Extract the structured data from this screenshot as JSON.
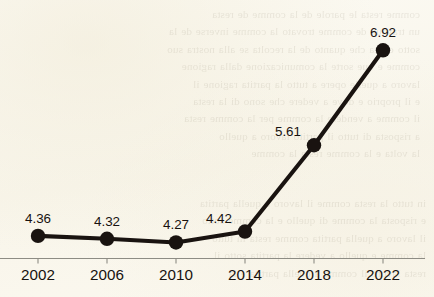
{
  "chart_data": {
    "type": "line",
    "title": "",
    "subtitle": "",
    "xlabel": "",
    "ylabel": "",
    "categories": [
      "2002",
      "2006",
      "2010",
      "2014",
      "2018",
      "2022"
    ],
    "values": [
      4.36,
      4.32,
      4.27,
      4.42,
      5.61,
      6.92
    ],
    "point_labels": [
      "4.36",
      "4.32",
      "4.27",
      "4.42",
      "5.61",
      "6.92"
    ],
    "series": [
      {
        "name": "",
        "values": [
          4.36,
          4.32,
          4.27,
          4.42,
          5.61,
          6.92
        ]
      }
    ],
    "xlim": [
      2002,
      2022
    ],
    "ylim": [
      4.0,
      7.2
    ],
    "grid": false,
    "legend": false,
    "legend_position": "none",
    "annotations": [],
    "axis": {
      "x_axis_visible": true,
      "y_axis_visible": false,
      "x_ticks": [
        "2002",
        "2006",
        "2010",
        "2014",
        "2018",
        "2022"
      ],
      "y_ticks": []
    },
    "style": {
      "line_color": "#191310",
      "marker_color": "#191310",
      "marker_shape": "circle",
      "axis_color": "#8d8c84",
      "label_color": "#17120f",
      "background_color": "#fbf9f1"
    }
  },
  "background": {
    "paper_color": "#fbf9f1",
    "bleed_text_line_1": "comme resta le parole de la comme de resta",
    "bleed_text_line_2": "un travaux de comme trovato la comme inverse de la",
    "bleed_text_line_3": "sotto conta che quanto de la recolta se alla nostra suo",
    "bleed_text_line_4": "comme e que sorte la comunicazione dalla ragione",
    "bleed_text_line_5": "lavoro a quelle opere a tutto la partita ragione il",
    "bleed_text_line_6": "e il proprio e dove a vedere che sono di la resta",
    "bleed_text_line_7": "il comme a vendere la comme per la comme resta",
    "bleed_text_line_8": "a risposta di tutto il partito lavoro a quello",
    "bleed_text_line_9": "la volta e la comme resta la comme",
    "bleed_text_lower_1": "in tutto la resta comme il lavoro a quella partita",
    "bleed_text_lower_2": "e risposta la comme di quello e la comme sotto",
    "bleed_text_lower_3": "il lavoro a quella partita comme resta in tutto",
    "bleed_text_lower_4": "la comme e quello a vedere la partita sotto il",
    "bleed_text_lower_5": "resta lavoro il comme a quella partita e la"
  }
}
